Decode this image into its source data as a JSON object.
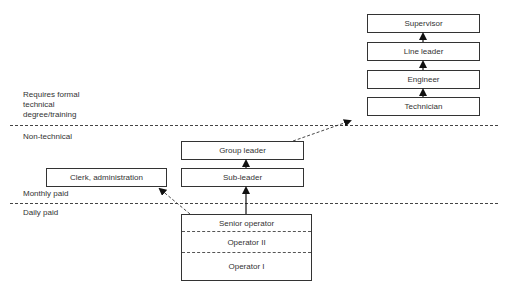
{
  "zones": {
    "technical": "Requires formal technical degree/training",
    "technical_lines": [
      "Requires formal",
      "technical",
      "degree/training"
    ],
    "non_technical": "Non-technical",
    "monthly_paid": "Monthly paid",
    "daily_paid": "Daily paid"
  },
  "technical_ladder": [
    "Supervisor",
    "Line leader",
    "Engineer",
    "Technician"
  ],
  "non_technical_ladder": [
    "Group leader",
    "Sub-leader"
  ],
  "clerk": "Clerk, administration",
  "operators": [
    "Senior operator",
    "Operator II",
    "Operator I"
  ],
  "colors": {
    "line": "#333333",
    "background": "#ffffff"
  }
}
